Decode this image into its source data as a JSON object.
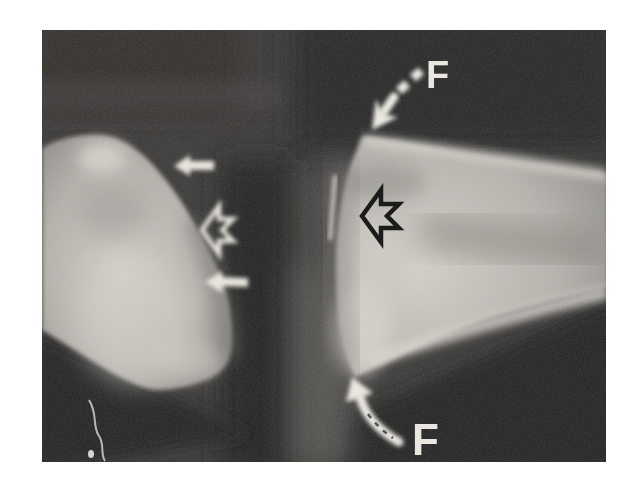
{
  "figure": {
    "kind": "radiograph",
    "alt": "Lateral radiograph of a joint between two bones, annotated with force arrows and marker arrows",
    "labels": {
      "top_force": "F",
      "bottom_force": "F"
    },
    "colors": {
      "page_background": "#ffffff",
      "film_dark": "#383633",
      "bone_light": "#cdcac3",
      "annotation_white": "#ebe9e1",
      "annotation_black": "#1b1b1b"
    },
    "annotations": [
      {
        "icon": "curved-dashed-arrow-icon",
        "color": "white",
        "label": "F",
        "position": "top-right"
      },
      {
        "icon": "curved-arrow-icon",
        "color": "white",
        "label": "F",
        "position": "bottom-center"
      },
      {
        "icon": "solid-left-arrow-icon",
        "color": "white",
        "position": "upper-joint-margin"
      },
      {
        "icon": "open-left-arrow-icon",
        "color": "white",
        "position": "mid-joint-space"
      },
      {
        "icon": "solid-left-arrow-icon",
        "color": "white",
        "position": "lower-joint-margin"
      },
      {
        "icon": "open-left-arrow-icon",
        "color": "black",
        "position": "right-bone-near-joint"
      }
    ]
  }
}
